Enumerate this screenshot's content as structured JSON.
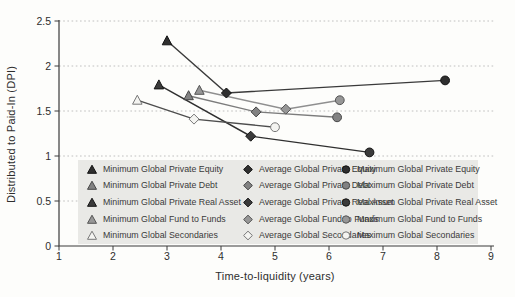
{
  "figure": {
    "background": "#fdfdfb",
    "axis_color": "#3a3a3a",
    "grid_color": "#b9b9b9",
    "text_color": "#2e2e2e"
  },
  "chart_data": {
    "type": "line",
    "title": "",
    "xlabel": "Time-to-liquidity (years)",
    "ylabel": "Distributed to Paid-In (DPI)",
    "xlim": [
      1,
      9
    ],
    "ylim": [
      0,
      2.5
    ],
    "x_ticks": [
      "1",
      "2",
      "3",
      "4",
      "5",
      "6",
      "7",
      "8",
      "9"
    ],
    "y_ticks": [
      "0",
      "0.5",
      "1",
      "1.5",
      "2",
      "2.5"
    ],
    "grid": "horizontal-dotted",
    "legend_position": "inside-bottom",
    "point_kinds": [
      {
        "key": "min",
        "marker": "triangle",
        "prefix": "Minimum"
      },
      {
        "key": "avg",
        "marker": "diamond",
        "prefix": "Average"
      },
      {
        "key": "max",
        "marker": "circle",
        "prefix": "Maximum"
      }
    ],
    "series": [
      {
        "name": "Global Private Equity",
        "line_color": "#3a3a3a",
        "fill": "#2f2f2f",
        "stroke": "#121212",
        "points": {
          "min": [
            3.0,
            2.28
          ],
          "avg": [
            4.1,
            1.7
          ],
          "max": [
            8.15,
            1.84
          ]
        }
      },
      {
        "name": "Global Private Debt",
        "line_color": "#7c7c7c",
        "fill": "#828282",
        "stroke": "#474747",
        "points": {
          "min": [
            3.4,
            1.67
          ],
          "avg": [
            4.65,
            1.49
          ],
          "max": [
            6.15,
            1.43
          ]
        }
      },
      {
        "name": "Global Private Real Asset",
        "line_color": "#2f2f2f",
        "fill": "#3b3b3b",
        "stroke": "#141414",
        "points": {
          "min": [
            2.85,
            1.79
          ],
          "avg": [
            4.55,
            1.22
          ],
          "max": [
            6.75,
            1.04
          ]
        }
      },
      {
        "name": "Global Fund to Funds",
        "line_color": "#8f8f8f",
        "fill": "#979797",
        "stroke": "#555555",
        "points": {
          "min": [
            3.6,
            1.73
          ],
          "avg": [
            5.2,
            1.52
          ],
          "max": [
            6.2,
            1.62
          ]
        }
      },
      {
        "name": "Global Secondaries",
        "line_color": "#4d4d4d",
        "fill": "#f4f4f1",
        "stroke": "#787878",
        "points": {
          "min": [
            2.45,
            1.62
          ],
          "avg": [
            3.5,
            1.41
          ],
          "max": [
            5.0,
            1.32
          ]
        }
      }
    ],
    "legend": {
      "background": "#e9e9e6",
      "columns": [
        {
          "marker": "triangle",
          "labels": [
            "Minimum Global Private Equity",
            "Minimum Global Private Debt",
            "Minimum Global Private Real Asset",
            "Minimum Global Fund to Funds",
            "Minimum Global Secondaries"
          ]
        },
        {
          "marker": "diamond",
          "labels": [
            "Average Global Private Equity",
            "Average Global Private Debt",
            "Average Global Private Real Asset",
            "Average Global Fund to Funds",
            "Average Global Secondaries"
          ]
        },
        {
          "marker": "circle",
          "labels": [
            "Maximum Global Private Equity",
            "Maximum Global Private Debt",
            "Maximum Global Private Real Asset",
            "Maximum Global Fund to Funds",
            "Maximum Global Secondaries"
          ]
        }
      ]
    }
  }
}
